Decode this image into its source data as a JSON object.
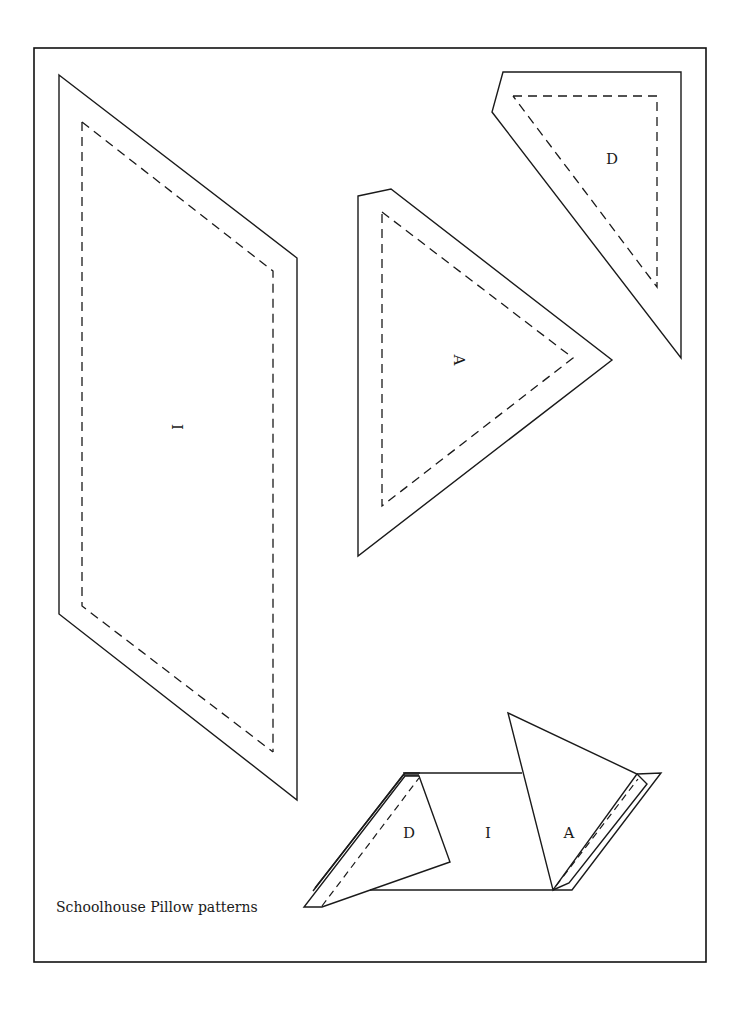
{
  "caption": "Schoolhouse Pillow patterns",
  "pieces": {
    "I": {
      "label": "I",
      "label_rotation_deg": 90
    },
    "A": {
      "label": "A",
      "label_rotation_deg": 90
    },
    "D": {
      "label": "D",
      "label_rotation_deg": 0
    }
  },
  "assembly": {
    "labels": {
      "D": "D",
      "I": "I",
      "A": "A"
    }
  },
  "colors": {
    "line": "#1a1a1a",
    "background": "#ffffff"
  },
  "legend": {
    "solid_line": "cutting line",
    "dashed_line": "seam line"
  }
}
